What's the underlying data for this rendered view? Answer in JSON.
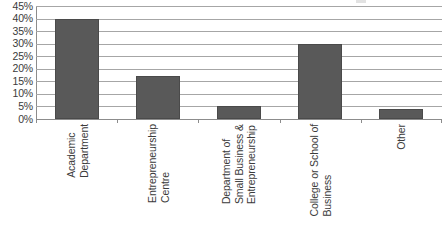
{
  "chart_data": {
    "type": "bar",
    "title": "",
    "xlabel": "",
    "ylabel": "",
    "categories": [
      "Academic Department",
      "Entrepreneurship Centre",
      "Department of Small Business & Entrepreneurship",
      "College or School of Business",
      "Other"
    ],
    "category_lines": [
      [
        "Academic",
        "Department"
      ],
      [
        "Entrepreneurship",
        "Centre"
      ],
      [
        "Department of",
        "Small Business &",
        "Entrepreneurship"
      ],
      [
        "College or School of",
        "Business"
      ],
      [
        "Other"
      ]
    ],
    "values": [
      40,
      17,
      5,
      30,
      4
    ],
    "value_labels": [
      "40%",
      "17%",
      "5%",
      "30%",
      "4%"
    ],
    "ylim": [
      0,
      45
    ],
    "ytick_labels": [
      "45%",
      "40%",
      "35%",
      "30%",
      "25%",
      "20%",
      "15%",
      "10%",
      "5%",
      "0%"
    ],
    "ytick_values": [
      45,
      40,
      35,
      30,
      25,
      20,
      15,
      10,
      5,
      0
    ],
    "grid": true,
    "legend": false,
    "legend_position": "none",
    "colors": {
      "bar_fill": "#595959",
      "bar_border": "#4a4a4a",
      "gridline": "#a6a6a6",
      "axis_line": "#8c8c8c",
      "text": "#3b3b3b",
      "background": "#ffffff"
    }
  }
}
